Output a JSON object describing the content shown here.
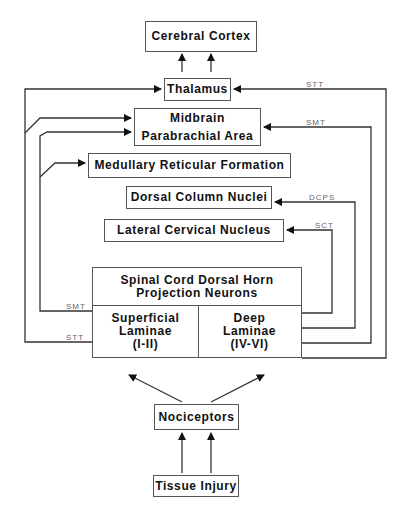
{
  "nodes": {
    "cortex": "Cerebral Cortex",
    "thalamus": "Thalamus",
    "midbrain": "Midbrain",
    "parabrachial": "Parabrachial Area",
    "medullary": "Medullary Reticular Formation",
    "dorsal_column": "Dorsal Column Nuclei",
    "lateral_cervical": "Lateral Cervical Nucleus",
    "spinal_header": "Spinal Cord Dorsal Horn\nProjection Neurons",
    "superficial": "Superficial\nLaminae\n(I-II)",
    "deep": "Deep\nLaminae\n(IV-VI)",
    "nociceptors": "Nociceptors",
    "tissue_injury": "Tissue Injury"
  },
  "tracts": {
    "stt_right": "STT",
    "smt_right": "SMT",
    "dcps": "DCPS",
    "sct": "SCT",
    "smt_left": "SMT",
    "stt_left": "STT"
  },
  "colors": {
    "line": "#333333",
    "border": "#555555",
    "label": "#666666"
  }
}
